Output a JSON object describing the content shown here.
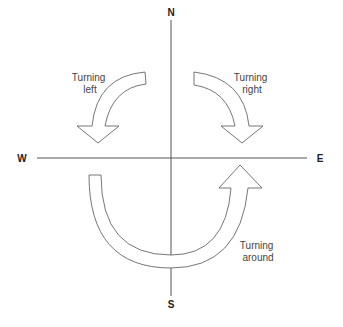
{
  "directions": {
    "north": "N",
    "south": "S",
    "east": "E",
    "west": "W"
  },
  "arrows": [
    {
      "id": "turning-left",
      "line1": "Turning",
      "line2": "left"
    },
    {
      "id": "turning-right",
      "line1": "Turning",
      "line2": "right"
    },
    {
      "id": "turning-around",
      "line1": "Turning",
      "line2": "around"
    }
  ],
  "colors": {
    "axis": "#555555",
    "arrow_stroke": "#666666",
    "arrow_fill": "#ffffff",
    "text": "#444444"
  }
}
